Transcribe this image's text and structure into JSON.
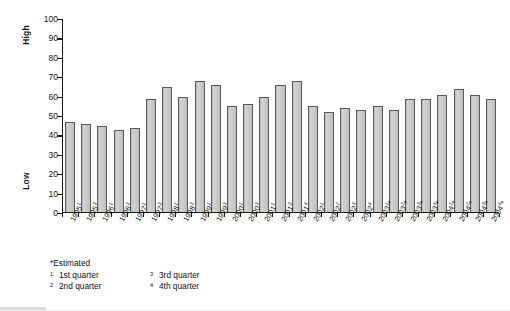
{
  "chart_data": {
    "type": "bar",
    "title": "",
    "xlabel": "",
    "ylabel": "",
    "ylim": [
      0,
      100
    ],
    "ytick_values": [
      0,
      10,
      20,
      30,
      40,
      50,
      60,
      70,
      80,
      90,
      100
    ],
    "grid": false,
    "legend_position": "none",
    "y_axis_top_label": "High",
    "y_axis_bottom_label": "Low",
    "categories": [
      "1995¹",
      "1995³",
      "1996¹",
      "1996³",
      "1997¹",
      "1997³",
      "1998¹",
      "1998³",
      "1999¹",
      "1999³",
      "2000¹",
      "2000³",
      "2001¹",
      "2001³",
      "2001⁴",
      "2002¹",
      "2002²",
      "2002³",
      "2002⁴",
      "2003¹*",
      "2003²*",
      "2003³*",
      "2003⁴*",
      "2004¹*",
      "2004²*",
      "2004³*",
      "2004⁴*"
    ],
    "category_parts": [
      {
        "year": "1995",
        "quarter": "1",
        "estimated": ""
      },
      {
        "year": "1995",
        "quarter": "3",
        "estimated": ""
      },
      {
        "year": "1996",
        "quarter": "1",
        "estimated": ""
      },
      {
        "year": "1996",
        "quarter": "3",
        "estimated": ""
      },
      {
        "year": "1997",
        "quarter": "1",
        "estimated": ""
      },
      {
        "year": "1997",
        "quarter": "3",
        "estimated": ""
      },
      {
        "year": "1998",
        "quarter": "1",
        "estimated": ""
      },
      {
        "year": "1998",
        "quarter": "3",
        "estimated": ""
      },
      {
        "year": "1999",
        "quarter": "1",
        "estimated": ""
      },
      {
        "year": "1999",
        "quarter": "3",
        "estimated": ""
      },
      {
        "year": "2000",
        "quarter": "1",
        "estimated": ""
      },
      {
        "year": "2000",
        "quarter": "3",
        "estimated": ""
      },
      {
        "year": "2001",
        "quarter": "1",
        "estimated": ""
      },
      {
        "year": "2001",
        "quarter": "3",
        "estimated": ""
      },
      {
        "year": "2001",
        "quarter": "4",
        "estimated": ""
      },
      {
        "year": "2002",
        "quarter": "1",
        "estimated": ""
      },
      {
        "year": "2002",
        "quarter": "2",
        "estimated": ""
      },
      {
        "year": "2002",
        "quarter": "3",
        "estimated": ""
      },
      {
        "year": "2002",
        "quarter": "4",
        "estimated": ""
      },
      {
        "year": "2003",
        "quarter": "1",
        "estimated": "*"
      },
      {
        "year": "2003",
        "quarter": "2",
        "estimated": "*"
      },
      {
        "year": "2003",
        "quarter": "3",
        "estimated": "*"
      },
      {
        "year": "2003",
        "quarter": "4",
        "estimated": "*"
      },
      {
        "year": "2004",
        "quarter": "1",
        "estimated": "*"
      },
      {
        "year": "2004",
        "quarter": "2",
        "estimated": "*"
      },
      {
        "year": "2004",
        "quarter": "3",
        "estimated": "*"
      },
      {
        "year": "2004",
        "quarter": "4",
        "estimated": "*"
      }
    ],
    "values": [
      47,
      46,
      45,
      43,
      44,
      59,
      65,
      60,
      68,
      66,
      55,
      56,
      60,
      66,
      68,
      55,
      52,
      54,
      53,
      55,
      53,
      59,
      59,
      61,
      64,
      61,
      59
    ],
    "bar_color": "#c8c8c8",
    "bar_border_color": "#5a5a5a"
  },
  "footnotes": {
    "estimated": "*Estimated",
    "items": [
      {
        "marker": "1",
        "label": "1st quarter"
      },
      {
        "marker": "2",
        "label": "2nd quarter"
      },
      {
        "marker": "3",
        "label": "3rd quarter"
      },
      {
        "marker": "4",
        "label": "4th quarter"
      }
    ]
  }
}
